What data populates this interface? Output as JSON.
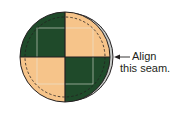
{
  "diagram": {
    "colors": {
      "dark_green": "#1f4a2a",
      "tan": "#f6c48a",
      "back_layer": "#c9ccc9",
      "outline": "#231f20",
      "inner_square": "#e8e8e0"
    },
    "pieces": {
      "top_left": "dark_green",
      "top_right": "tan",
      "bottom_left": "tan",
      "bottom_right": "dark_green"
    },
    "annotation": {
      "line1": "Align",
      "line2": "this seam.",
      "arrow": "arrow-left"
    }
  }
}
